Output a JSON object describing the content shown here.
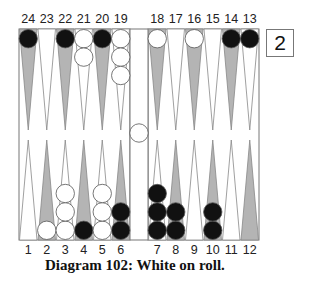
{
  "diagram": {
    "caption": "Diagram 102:  White on roll.",
    "cube_value": "2",
    "colors": {
      "dark_point": "#b4b4b4",
      "light_point": "#ffffff",
      "black_checker": "#111111",
      "white_checker": "#ffffff",
      "border": "#777777"
    },
    "top_labels": [
      "24",
      "23",
      "22",
      "21",
      "20",
      "19",
      "18",
      "17",
      "16",
      "15",
      "14",
      "13"
    ],
    "bottom_labels": [
      "1",
      "2",
      "3",
      "4",
      "5",
      "6",
      "7",
      "8",
      "9",
      "10",
      "11",
      "12"
    ],
    "position": {
      "black": {
        "24": 1,
        "22": 1,
        "20": 1,
        "14": 1,
        "13": 1,
        "4": 1,
        "6": 2,
        "7": 3,
        "8": 2,
        "10": 2
      },
      "white": {
        "21": 2,
        "19": 3,
        "18": 1,
        "16": 1,
        "2": 1,
        "3": 3,
        "5": 3
      },
      "white_on_bar": 1
    }
  }
}
